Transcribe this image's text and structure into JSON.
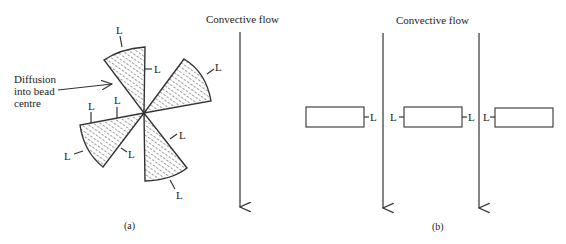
{
  "figure": {
    "panel_a": {
      "caption": "(a)",
      "flow_label": "Convective flow",
      "diffusion_label_lines": [
        "Diffusion",
        "into bead",
        "centre"
      ],
      "length_marker": "L",
      "sector_count": 4
    },
    "panel_b": {
      "caption": "(b)",
      "flow_label": "Convective flow",
      "length_marker": "L",
      "slab_count": 3,
      "flow_arrow_count": 2
    },
    "colors": {
      "line": "#333333",
      "background": "#ffffff",
      "hatch": "#555555"
    }
  }
}
